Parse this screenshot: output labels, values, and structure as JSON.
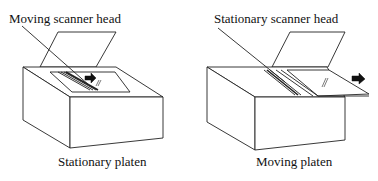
{
  "diagrams": [
    {
      "head_label": "Moving scanner head",
      "caption": "Stationary platen"
    },
    {
      "head_label": "Stationary scanner head",
      "caption": "Moving platen"
    }
  ],
  "colors": {
    "line": "#222222",
    "background": "#ffffff"
  }
}
